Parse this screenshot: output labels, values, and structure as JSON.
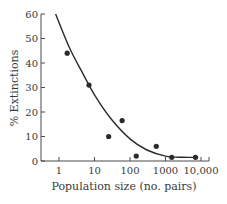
{
  "chart_data": {
    "type": "scatter",
    "title": "",
    "xlabel": "Population size (no. pairs)",
    "ylabel": "% Extinctions",
    "xscale": "log",
    "xlim": [
      0.6,
      20000
    ],
    "ylim": [
      0,
      60
    ],
    "grid": false,
    "legend": null,
    "x_ticks": [
      1,
      10,
      100,
      1000,
      10000
    ],
    "x_tick_labels": [
      "1",
      "10",
      "100",
      "1000",
      "10,000"
    ],
    "y_ticks": [
      0,
      10,
      20,
      30,
      40,
      50,
      60
    ],
    "y_tick_labels": [
      "0",
      "10",
      "20",
      "30",
      "40",
      "50",
      "60"
    ],
    "series": [
      {
        "name": "Observed",
        "kind": "scatter",
        "points": [
          {
            "x": 1.7,
            "y": 44
          },
          {
            "x": 7,
            "y": 31
          },
          {
            "x": 25,
            "y": 10
          },
          {
            "x": 60,
            "y": 16.5
          },
          {
            "x": 150,
            "y": 2
          },
          {
            "x": 550,
            "y": 6
          },
          {
            "x": 1500,
            "y": 1.5
          },
          {
            "x": 7000,
            "y": 1.5
          }
        ]
      },
      {
        "name": "Fitted curve",
        "kind": "line",
        "points": [
          {
            "x": 0.8,
            "y": 60
          },
          {
            "x": 2,
            "y": 46
          },
          {
            "x": 5,
            "y": 35
          },
          {
            "x": 10,
            "y": 27
          },
          {
            "x": 30,
            "y": 17
          },
          {
            "x": 100,
            "y": 9
          },
          {
            "x": 300,
            "y": 4.5
          },
          {
            "x": 1000,
            "y": 2
          },
          {
            "x": 3000,
            "y": 1.5
          },
          {
            "x": 8000,
            "y": 1.5
          }
        ]
      }
    ]
  }
}
